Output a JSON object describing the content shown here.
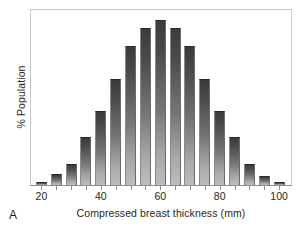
{
  "figure": {
    "panel_label": "A",
    "frame_color": "#c8c8c8",
    "axis_color": "#8e8e8e",
    "bar_top_color": "#3b3b3b",
    "bar_bottom_color": "#bdbdbd"
  },
  "chart_data": {
    "type": "bar",
    "title": "",
    "subtitle": "",
    "xlabel": "Compressed breast thickness (mm)",
    "ylabel": "% Population",
    "categories": [
      20,
      25,
      30,
      35,
      40,
      45,
      50,
      55,
      60,
      65,
      70,
      75,
      80,
      85,
      90,
      95,
      100
    ],
    "tick_labels": [
      "20",
      "40",
      "60",
      "80",
      "100"
    ],
    "tick_values": [
      20,
      40,
      60,
      80,
      100
    ],
    "minor_tick_values": [
      20,
      25,
      30,
      35,
      40,
      45,
      50,
      55,
      60,
      65,
      70,
      75,
      80,
      85,
      90,
      95,
      100
    ],
    "values": [
      0.4,
      1.7,
      3.2,
      7.4,
      11.4,
      16.4,
      21.5,
      24.3,
      25.4,
      24.3,
      21.5,
      16.4,
      11.4,
      7.4,
      3.2,
      1.4,
      0.4
    ],
    "series": [
      {
        "name": "% Population",
        "values": [
          0.4,
          1.7,
          3.2,
          7.4,
          11.4,
          16.4,
          21.5,
          24.3,
          25.4,
          24.3,
          21.5,
          16.4,
          11.4,
          7.4,
          3.2,
          1.4,
          0.4
        ]
      }
    ],
    "xlim": [
      16.5,
      104
    ],
    "ylim": [
      0,
      27
    ],
    "grid": false,
    "legend": null,
    "legend_position": "none",
    "bar_width_mm": 3.7,
    "annotations": []
  }
}
